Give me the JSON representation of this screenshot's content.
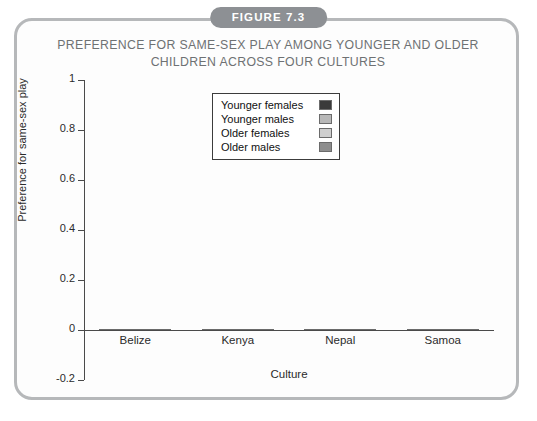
{
  "figure": {
    "badge_label": "FIGURE 7.3",
    "title_line1": "PREFERENCE FOR SAME-SEX PLAY AMONG YOUNGER AND OLDER",
    "title_line2": "CHILDREN ACROSS FOUR CULTURES",
    "border_color": "#b6b8ba",
    "badge_color": "#8d9094",
    "title_color": "#6e7173"
  },
  "chart_data": {
    "type": "bar",
    "title": "PREFERENCE FOR SAME-SEX PLAY AMONG YOUNGER AND OLDER CHILDREN ACROSS FOUR CULTURES",
    "xlabel": "Culture",
    "ylabel": "Preference for same-sex play",
    "categories": [
      "Belize",
      "Kenya",
      "Nepal",
      "Samoa"
    ],
    "ylim": [
      -0.2,
      1
    ],
    "yticks": [
      1,
      0.8,
      0.6,
      0.4,
      0.2,
      0
    ],
    "ytick_labels": [
      "1",
      "0.8",
      "0.6",
      "0.4",
      "0.2",
      "0"
    ],
    "ytick_bottom_label": "-0.2",
    "grid": false,
    "legend_position": "upper center",
    "series": [
      {
        "name": "Younger females",
        "color": "#3b3b3b",
        "values": [
          0.26,
          0.03,
          0.15,
          0.05
        ]
      },
      {
        "name": "Younger males",
        "color": "#b8b8b8",
        "values": [
          0.19,
          0.33,
          0.19,
          0.0
        ]
      },
      {
        "name": "Older females",
        "color": "#cfcfcf",
        "values": [
          0.48,
          0.23,
          0.38,
          0.13
        ]
      },
      {
        "name": "Older males",
        "color": "#8e8e8e",
        "values": [
          0.96,
          0.42,
          0.7,
          0.5
        ]
      }
    ]
  }
}
